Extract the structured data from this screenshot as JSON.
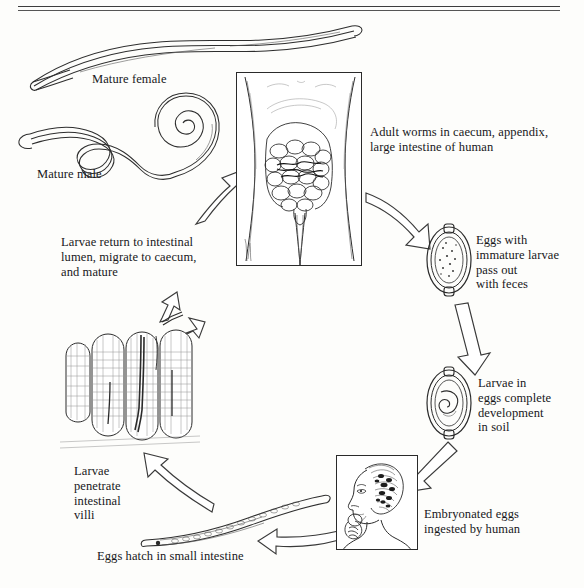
{
  "figure": {
    "type": "life-cycle-diagram",
    "style": "black-and-white line drawing, scanned textbook plate",
    "cycle_direction": "clockwise"
  },
  "labels": {
    "mature_female": "Mature female",
    "mature_male": "Mature male",
    "adult_worms": "Adult worms in caecum, appendix,\nlarge intestine of human",
    "eggs_immature": "Eggs with\nimmature larvae\npass out\nwith feces",
    "larvae_soil": "Larvae in\neggs complete\ndevelopment\nin soil",
    "ingested": "Embryonated eggs\ningested by human",
    "eggs_hatch": "Eggs hatch in small intestine",
    "penetrate_villi": "Larvae\npenetrate\nintestinal\nvilli",
    "larvae_return": "Larvae return to intestinal\nlumen, migrate to caecum,\nand mature"
  },
  "illustrations": {
    "mature_female": "long slender whipworm with thin anterior whip end, sinuous body",
    "mature_male": "whipworm with coiled spiral posterior end",
    "human_torso": "anterior view of human abdomen showing large and small intestine, caecum and appendix",
    "egg_immature": "barrel-shaped egg with bipolar plugs containing granular unsegmented contents",
    "egg_embryonated": "barrel-shaped egg with bipolar plugs containing coiled larva",
    "human_head": "profile of person raising contaminated hand to mouth",
    "hatched_larva": "elongate larva in small intestine",
    "intestinal_villi": "section of intestinal mucosa with finger-like villi penetrated by larvae"
  },
  "stages": [
    {
      "id": 1,
      "name": "Adult worms in caecum, appendix, large intestine of human"
    },
    {
      "id": 2,
      "name": "Eggs with immature larvae pass out with feces"
    },
    {
      "id": 3,
      "name": "Larvae in eggs complete development in soil"
    },
    {
      "id": 4,
      "name": "Embryonated eggs ingested by human"
    },
    {
      "id": 5,
      "name": "Eggs hatch in small intestine"
    },
    {
      "id": 6,
      "name": "Larvae penetrate intestinal villi"
    },
    {
      "id": 7,
      "name": "Larvae return to intestinal lumen, migrate to caecum, and mature"
    }
  ],
  "colors": {
    "background": "#fdfdfb",
    "ink": "#2b2b2b",
    "text": "#17171a",
    "arrow_fill": "#ffffff"
  }
}
